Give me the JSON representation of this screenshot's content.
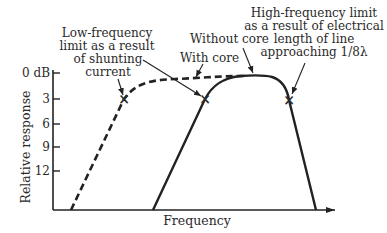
{
  "diagram": {
    "y_axis_label": "Relative response",
    "x_axis_label": "Frequency",
    "y_ticks": [
      "0 dB",
      "3",
      "6",
      "9",
      "12"
    ],
    "annotations": {
      "low_freq": [
        "Low-frequency",
        "limit as a result",
        "of shunting",
        "current"
      ],
      "high_freq": [
        "High-frequency limit",
        "as a result of electrical",
        "length of line",
        "approaching 1/8λ"
      ],
      "without_core": "Without core",
      "with_core": "With core"
    },
    "marker_glyph": "×"
  },
  "colors": {
    "ink": "#222222",
    "background": "#ffffff"
  }
}
